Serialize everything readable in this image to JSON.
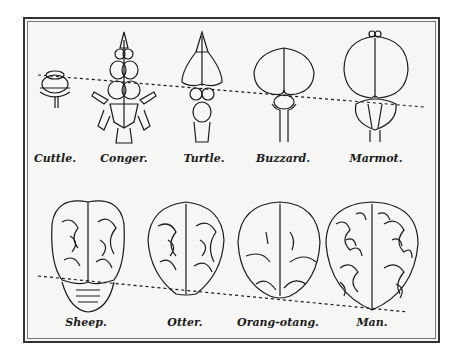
{
  "figure": {
    "top_row": [
      {
        "name": "cuttle",
        "label": "Cuttle.",
        "x": 55
      },
      {
        "name": "conger",
        "label": "Conger.",
        "x": 124
      },
      {
        "name": "turtle",
        "label": "Turtle.",
        "x": 204
      },
      {
        "name": "buzzard",
        "label": "Buzzard.",
        "x": 283
      },
      {
        "name": "marmot",
        "label": "Marmot.",
        "x": 376
      }
    ],
    "bottom_row": [
      {
        "name": "sheep",
        "label": "Sheep.",
        "x": 86
      },
      {
        "name": "otter",
        "label": "Otter.",
        "x": 185
      },
      {
        "name": "orang-otang",
        "label": "Orang-otang.",
        "x": 278
      },
      {
        "name": "man",
        "label": "Man.",
        "x": 372
      }
    ],
    "colors": {
      "ink": "#1a1a1a",
      "paper": "#f6f6f4",
      "border": "#333333"
    }
  }
}
